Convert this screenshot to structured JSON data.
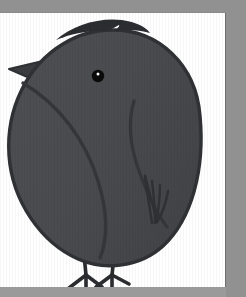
{
  "artwork": {
    "title": "Bird illustration",
    "subject": "round dark bird standing on two legs",
    "medium": "flat vector drawing",
    "alt_text": "A plump round dark-gray bird in side profile facing left, with a pointed beak, a single black eye with a white highlight, a swept crest on its head, a curved wing outline, feathered tail at the lower right, and two thin legs with three-toed feet.",
    "caption": ""
  },
  "canvas": {
    "label": "artboard",
    "background": "#ffffff",
    "width": "226",
    "height": "274"
  },
  "surround": {
    "label": "page background",
    "background": "#919191",
    "top_band_height": "13",
    "bottom_band_height": "10",
    "right_gutter_width": "20"
  },
  "palette": {
    "body_fill": "#4a4c4f",
    "body_fill_shadow": "#44464a",
    "outline": "#2f3134",
    "crest": "#2b2d30",
    "beak": "#3a3c40",
    "eye": "#0a0a0a",
    "eye_highlight": "#ffffff",
    "leg": "#2a2c2f",
    "paper": "#ffffff",
    "surround_gray": "#919191",
    "panel_edge": "#6e6e6e"
  },
  "parts": [
    {
      "name": "body",
      "label": "Body"
    },
    {
      "name": "head-crest",
      "label": "Head crest"
    },
    {
      "name": "beak",
      "label": "Beak"
    },
    {
      "name": "eye",
      "label": "Eye"
    },
    {
      "name": "eye-highlight",
      "label": "Eye highlight"
    },
    {
      "name": "wing",
      "label": "Wing"
    },
    {
      "name": "breast-line",
      "label": "Breast line"
    },
    {
      "name": "tail-feathers",
      "label": "Tail feathers"
    },
    {
      "name": "left-leg",
      "label": "Left leg"
    },
    {
      "name": "right-leg",
      "label": "Right leg"
    }
  ]
}
